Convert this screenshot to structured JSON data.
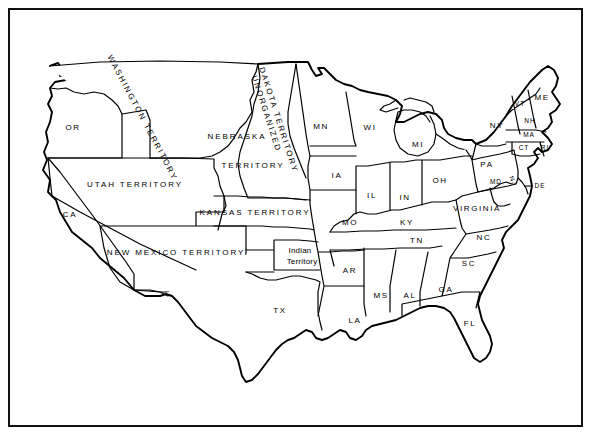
{
  "figure": {
    "background_color": "#ffffff",
    "line_color": "#000000",
    "frame": "thin black rectangular border"
  },
  "map": {
    "type": "historical-political-map",
    "region": "Continental United States",
    "era_note": "Pre-Civil War era: western lands shown as organized and unorganized territories",
    "territories": [
      {
        "id": "washington-territory",
        "label": "WASHINGTON TERRITORY",
        "x": 142,
        "y": 118,
        "rotation": 62,
        "style": "caps-spaced"
      },
      {
        "id": "unorganized-dakota-territory",
        "label": "UNORGANIZED\nDAKOTA TERRITORY",
        "line1": "UNORGANIZED",
        "line2": "DAKOTA TERRITORY",
        "x": 272,
        "y": 120,
        "rotation": 72,
        "style": "caps-spaced"
      },
      {
        "id": "nebraska-territory",
        "label": "NEBRASKA TERRITORY",
        "line1": "NEBRASKA",
        "line2": "TERRITORY",
        "x1": 237,
        "y1": 137,
        "x2": 253,
        "y2": 166,
        "style": "caps-spaced"
      },
      {
        "id": "utah-territory",
        "label": "UTAH TERRITORY",
        "x": 135,
        "y": 185,
        "rotation": 0,
        "style": "caps-spaced"
      },
      {
        "id": "kansas-territory",
        "label": "KANSAS TERRITORY",
        "x": 255,
        "y": 213,
        "rotation": 0,
        "style": "caps-spaced"
      },
      {
        "id": "new-mexico-territory",
        "label": "NEW MEXICO TERRITORY",
        "x": 176,
        "y": 253,
        "rotation": 0,
        "style": "caps-spaced"
      },
      {
        "id": "indian-territory",
        "label": "Indian Territory",
        "line1": "Indian",
        "line2": "Territory",
        "x": 300,
        "y": 256,
        "rotation": 0,
        "style": "mixed-case"
      }
    ],
    "states": [
      {
        "id": "or",
        "label": "OR",
        "x": 73,
        "y": 128
      },
      {
        "id": "ca",
        "label": "CA",
        "x": 70,
        "y": 215
      },
      {
        "id": "tx",
        "label": "TX",
        "x": 280,
        "y": 311
      },
      {
        "id": "mn",
        "label": "MN",
        "x": 321,
        "y": 127
      },
      {
        "id": "wi",
        "label": "WI",
        "x": 370,
        "y": 128
      },
      {
        "id": "mi",
        "label": "MI",
        "x": 418,
        "y": 145
      },
      {
        "id": "ia",
        "label": "IA",
        "x": 337,
        "y": 176
      },
      {
        "id": "il",
        "label": "IL",
        "x": 372,
        "y": 196
      },
      {
        "id": "in",
        "label": "IN",
        "x": 405,
        "y": 198
      },
      {
        "id": "oh",
        "label": "OH",
        "x": 440,
        "y": 181
      },
      {
        "id": "ky",
        "label": "KY",
        "x": 407,
        "y": 223
      },
      {
        "id": "mo",
        "label": "MO",
        "x": 350,
        "y": 223
      },
      {
        "id": "tn",
        "label": "TN",
        "x": 417,
        "y": 241
      },
      {
        "id": "ar",
        "label": "AR",
        "x": 350,
        "y": 271
      },
      {
        "id": "ms",
        "label": "MS",
        "x": 381,
        "y": 296
      },
      {
        "id": "al",
        "label": "AL",
        "x": 410,
        "y": 296
      },
      {
        "id": "ga",
        "label": "GA",
        "x": 446,
        "y": 290
      },
      {
        "id": "la",
        "label": "LA",
        "x": 355,
        "y": 321
      },
      {
        "id": "fl",
        "label": "FL",
        "x": 470,
        "y": 324
      },
      {
        "id": "sc",
        "label": "SC",
        "x": 469,
        "y": 264
      },
      {
        "id": "nc",
        "label": "NC",
        "x": 484,
        "y": 238
      },
      {
        "id": "virginia",
        "label": "VIRGINIA",
        "x": 477,
        "y": 209
      },
      {
        "id": "pa",
        "label": "PA",
        "x": 487,
        "y": 165
      },
      {
        "id": "ny",
        "label": "NY",
        "x": 497,
        "y": 126
      },
      {
        "id": "vt",
        "label": "VT",
        "x": 520,
        "y": 104
      },
      {
        "id": "nh",
        "label": "NH",
        "x": 530,
        "y": 121
      },
      {
        "id": "me",
        "label": "ME",
        "x": 542,
        "y": 98
      },
      {
        "id": "ma",
        "label": "MA",
        "x": 529,
        "y": 135
      },
      {
        "id": "ct",
        "label": "CT",
        "x": 524,
        "y": 148
      },
      {
        "id": "ri",
        "label": "RI",
        "x": 545,
        "y": 148
      },
      {
        "id": "nj",
        "label": "NJ",
        "x": 513,
        "y": 181,
        "rotation": 62
      },
      {
        "id": "de",
        "label": "DE",
        "x": 537,
        "y": 186,
        "leader": true
      },
      {
        "id": "md",
        "label": "MD",
        "x": 496,
        "y": 182
      }
    ]
  }
}
